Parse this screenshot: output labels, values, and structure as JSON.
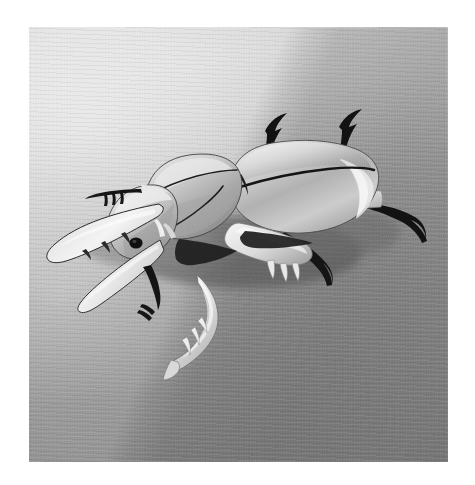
{
  "image": {
    "kind": "photograph",
    "medium": "black-and-white photograph",
    "subject": "paper / foil origami stag beetle model",
    "orientation": "three-quarter view facing left",
    "surface": "ribbed woven fabric cloth",
    "alt_text": "Black and white photograph of a folded paper stag beetle standing on ribbed fabric, its large curved mandibles pointing to the left and a soft diagonal shadow falling across the upper right of the background.",
    "border": {
      "color": "#ffffff",
      "left_px": 29,
      "top_px": 27,
      "right_px": 27,
      "bottom_px": 23
    },
    "frame": {
      "width_px": 475,
      "height_px": 485,
      "photo_width_px": 419,
      "photo_height_px": 435
    }
  },
  "palette": {
    "paper_white": "#ffffff",
    "background_light": "#dcdcdc",
    "background_mid": "#b4b4b4",
    "background_dark": "#8d8d8d",
    "shadow_gray": "#7a7a7a",
    "beetle_highlight": "#f2f2f2",
    "beetle_midtone": "#c9c9c9",
    "beetle_shadow": "#6d6d6d",
    "ink_black": "#101010"
  },
  "scene": {
    "background": {
      "description": "Soft graduated grey cloth with fine horizontal ribbing; a broad diagonal shadow edge crosses the upper right corner.",
      "shadow_edge_angle_deg": 113,
      "light_direction": "upper left"
    },
    "subject_parts": [
      {
        "name": "left-mandible-upper",
        "label": "Upper mandible",
        "tone": "#e4e4e4"
      },
      {
        "name": "left-mandible-lower",
        "label": "Lower mandible",
        "tone": "#dcdcdc"
      },
      {
        "name": "head",
        "label": "Head",
        "tone": "#cfcfcf"
      },
      {
        "name": "eye",
        "label": "Eye",
        "tone": "#121212"
      },
      {
        "name": "pronotum",
        "label": "Pronotum (thorax plate)",
        "tone": "#c6c6c6"
      },
      {
        "name": "elytra",
        "label": "Elytra (wing cases)",
        "tone": "#bdbdbd"
      },
      {
        "name": "elytral-suture",
        "label": "Elytral suture line",
        "tone": "#161616"
      },
      {
        "name": "foreleg-left",
        "label": "Front left leg with tarsal spines",
        "tone": "#ececec"
      },
      {
        "name": "midleg",
        "label": "Middle leg with tarsal claws",
        "tone": "#e8e8e8"
      },
      {
        "name": "hindleg-right",
        "label": "Rear right leg",
        "tone": "#e2e2e2"
      },
      {
        "name": "leg-tip-dark-1",
        "label": "Dark rear leg tip (upper left)",
        "tone": "#0e0e0e"
      },
      {
        "name": "leg-tip-dark-2",
        "label": "Dark rear leg tip (upper right)",
        "tone": "#0e0e0e"
      },
      {
        "name": "leg-tip-dark-3",
        "label": "Dark leg tip (right)",
        "tone": "#0e0e0e"
      },
      {
        "name": "antenna",
        "label": "Antenna",
        "tone": "#141414"
      },
      {
        "name": "cast-shadow",
        "label": "Cast shadow beneath body",
        "tone": "#6a6a6a"
      }
    ]
  }
}
